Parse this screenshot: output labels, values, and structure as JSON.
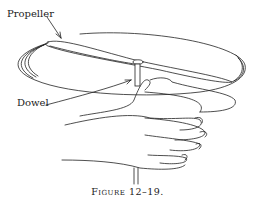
{
  "figure": {
    "labels": {
      "propeller": "Propeller",
      "dowel": "Dowel"
    },
    "caption": "Figure 12–19."
  }
}
